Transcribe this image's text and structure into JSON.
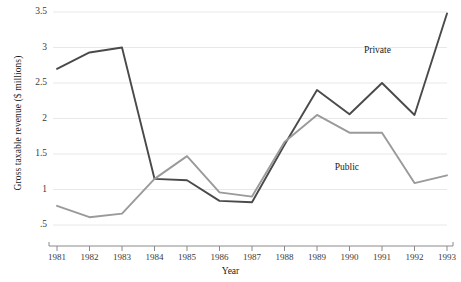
{
  "chart_data": {
    "type": "line",
    "title": "",
    "xlabel": "Year",
    "ylabel": "Gross taxable revenue ($ millions)",
    "categories": [
      1981,
      1982,
      1983,
      1984,
      1985,
      1986,
      1987,
      1988,
      1989,
      1990,
      1991,
      1992,
      1993
    ],
    "x": [
      "1981",
      "1982",
      "1983",
      "1984",
      "1985",
      "1986",
      "1987",
      "1988",
      "1989",
      "1990",
      "1991",
      "1992",
      "1993"
    ],
    "xlim": [
      1981,
      1993
    ],
    "ylim": [
      0.5,
      3.5
    ],
    "yticks": [
      0.5,
      1,
      1.5,
      2,
      2.5,
      3,
      3.5
    ],
    "ytick_labels": [
      ".5",
      "1",
      "1.5",
      "2",
      "2.5",
      "3",
      "3.5"
    ],
    "grid": true,
    "grid_axis": "y",
    "legend_position": "inline-annotation",
    "series": [
      {
        "name": "Private",
        "color": "#4a4a4a",
        "values": [
          2.7,
          2.93,
          3.0,
          1.15,
          1.13,
          0.84,
          0.82,
          1.63,
          2.4,
          2.06,
          2.5,
          2.05,
          3.48
        ],
        "label_x": 1991.0,
        "label_y": 2.95
      },
      {
        "name": "Public",
        "color": "#9a9a9a",
        "values": [
          0.77,
          0.61,
          0.66,
          1.15,
          1.47,
          0.96,
          0.9,
          1.67,
          2.05,
          1.8,
          1.8,
          1.09,
          1.2
        ],
        "label_x": 1990.1,
        "label_y": 1.3
      }
    ],
    "annotations": [
      {
        "text": "Private",
        "series": "Private"
      },
      {
        "text": "Public",
        "series": "Public"
      }
    ]
  },
  "axes": {
    "x_title": "Year",
    "y_title": "Gross taxable revenue ($ millions)"
  },
  "colors": {
    "private_line": "#4a4a4a",
    "public_line": "#9a9a9a",
    "grid": "#e8e8e8",
    "axis": "#8a8a8a",
    "text": "#1a1a1a"
  }
}
